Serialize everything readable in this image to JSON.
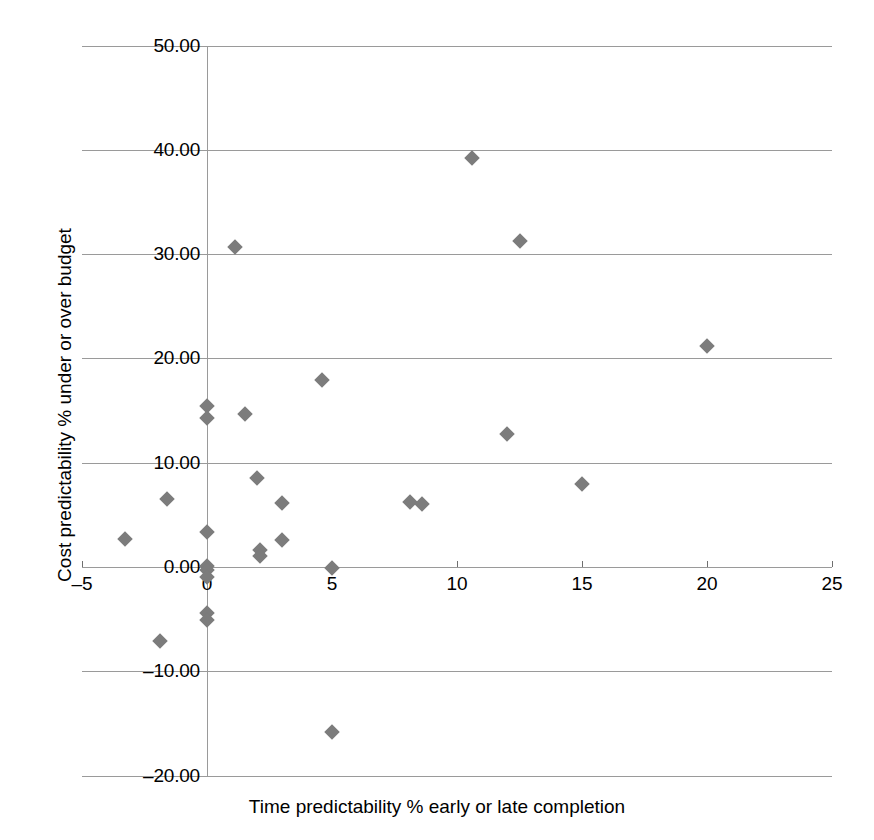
{
  "chart_data": {
    "type": "scatter",
    "title": "",
    "xlabel": "Time predictability % early or late completion",
    "ylabel": "Cost predictability % under or over budget",
    "xlim": [
      -5,
      25
    ],
    "ylim": [
      -20,
      50
    ],
    "xticks": [
      -5,
      0,
      5,
      10,
      15,
      20,
      25
    ],
    "xtick_labels": [
      "–5",
      "0",
      "5",
      "10",
      "15",
      "20",
      "25"
    ],
    "yticks": [
      -20,
      -10,
      0,
      10,
      20,
      30,
      40,
      50
    ],
    "ytick_labels": [
      "–20.00",
      "–10.00",
      "0.00",
      "10.00",
      "20.00",
      "30.00",
      "40.00",
      "50.00"
    ],
    "grid": "horizontal",
    "legend": "none",
    "marker": "diamond",
    "marker_color": "#7c7c7c",
    "series": [
      {
        "name": "Projects",
        "points": [
          {
            "x": 10.6,
            "y": 39.2
          },
          {
            "x": 12.5,
            "y": 31.3
          },
          {
            "x": 1.1,
            "y": 30.7
          },
          {
            "x": 20.0,
            "y": 21.2
          },
          {
            "x": 4.6,
            "y": 17.9
          },
          {
            "x": 0.0,
            "y": 15.4
          },
          {
            "x": 1.5,
            "y": 14.7
          },
          {
            "x": 0.0,
            "y": 14.3
          },
          {
            "x": 12.0,
            "y": 12.8
          },
          {
            "x": 2.0,
            "y": 8.5
          },
          {
            "x": 15.0,
            "y": 8.0
          },
          {
            "x": -1.6,
            "y": 6.5
          },
          {
            "x": 3.0,
            "y": 6.1
          },
          {
            "x": 8.1,
            "y": 6.2
          },
          {
            "x": 8.6,
            "y": 6.0
          },
          {
            "x": 0.0,
            "y": 3.4
          },
          {
            "x": -3.3,
            "y": 2.7
          },
          {
            "x": 3.0,
            "y": 2.6
          },
          {
            "x": 2.1,
            "y": 1.6
          },
          {
            "x": 2.1,
            "y": 1.1
          },
          {
            "x": 0.0,
            "y": 0.1
          },
          {
            "x": 0.0,
            "y": -0.3
          },
          {
            "x": 0.0,
            "y": -1.0
          },
          {
            "x": 5.0,
            "y": -0.1
          },
          {
            "x": 0.0,
            "y": -4.4
          },
          {
            "x": 0.0,
            "y": -5.1
          },
          {
            "x": -1.9,
            "y": -7.1
          },
          {
            "x": 5.0,
            "y": -15.8
          }
        ]
      }
    ]
  },
  "axes": {
    "x_title": "Time predictability % early or late completion",
    "y_title": "Cost predictability % under or over budget"
  }
}
